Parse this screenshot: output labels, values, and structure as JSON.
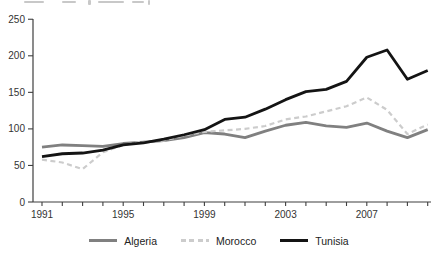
{
  "chart_data": {
    "type": "line",
    "title": "",
    "xlabel": "",
    "ylabel": "",
    "x": [
      1991,
      1992,
      1993,
      1994,
      1995,
      1996,
      1997,
      1998,
      1999,
      2000,
      2001,
      2002,
      2003,
      2004,
      2005,
      2006,
      2007,
      2008,
      2009,
      2010
    ],
    "series": [
      {
        "name": "Algeria",
        "color": "#808080",
        "style": "solid",
        "values": [
          75,
          78,
          77,
          76,
          80,
          82,
          84,
          88,
          95,
          93,
          88,
          97,
          105,
          109,
          104,
          102,
          108,
          97,
          88,
          99
        ]
      },
      {
        "name": "Morocco",
        "color": "#cccccc",
        "style": "dashed",
        "values": [
          58,
          54,
          45,
          68,
          78,
          83,
          84,
          91,
          96,
          98,
          100,
          104,
          113,
          117,
          124,
          131,
          143,
          126,
          93,
          106
        ]
      },
      {
        "name": "Tunisia",
        "color": "#141414",
        "style": "solid",
        "values": [
          62,
          66,
          67,
          71,
          78,
          81,
          86,
          92,
          99,
          113,
          116,
          127,
          140,
          151,
          154,
          165,
          198,
          208,
          168,
          180
        ]
      }
    ],
    "xlim": [
      1991,
      2010
    ],
    "ylim": [
      0,
      250
    ],
    "yticks": [
      0,
      50,
      100,
      150,
      200,
      250
    ],
    "xticks_labeled": [
      1991,
      1995,
      1999,
      2003,
      2007
    ],
    "grid": false,
    "legend_position": "bottom",
    "axis_color": "#3f3f3f"
  },
  "legend": {
    "items": [
      {
        "label": "Algeria"
      },
      {
        "label": "Morocco"
      },
      {
        "label": "Tunisia"
      }
    ]
  }
}
